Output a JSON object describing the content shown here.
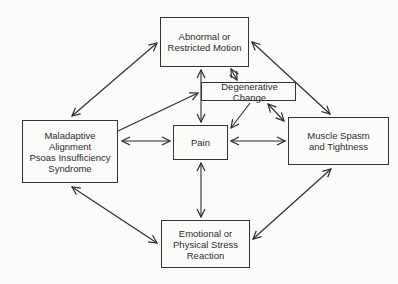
{
  "diagram": {
    "type": "flow",
    "nodes": [
      {
        "id": "abnormal",
        "label": "Abnormal or\nRestricted Motion"
      },
      {
        "id": "degen",
        "label": "Degenerative Change"
      },
      {
        "id": "malad",
        "label": "Maladaptive\nAlignment\nPsoas Insufficiency\nSyndrome"
      },
      {
        "id": "pain",
        "label": "Pain"
      },
      {
        "id": "muscle",
        "label": "Muscle Spasm\nand Tightness"
      },
      {
        "id": "emot",
        "label": "Emotional or\nPhysical Stress\nReaction"
      }
    ],
    "edges": [
      {
        "from": "malad",
        "to": "abnormal",
        "direction": "both"
      },
      {
        "from": "abnormal",
        "to": "muscle",
        "direction": "both"
      },
      {
        "from": "malad",
        "to": "emot",
        "direction": "both"
      },
      {
        "from": "muscle",
        "to": "emot",
        "direction": "both"
      },
      {
        "from": "abnormal",
        "to": "pain",
        "direction": "both"
      },
      {
        "from": "abnormal",
        "to": "degen",
        "direction": "both"
      },
      {
        "from": "malad",
        "to": "degen",
        "direction": "forward"
      },
      {
        "from": "degen",
        "to": "pain",
        "direction": "forward"
      },
      {
        "from": "degen",
        "to": "muscle",
        "direction": "both"
      },
      {
        "from": "malad",
        "to": "pain",
        "direction": "both"
      },
      {
        "from": "pain",
        "to": "muscle",
        "direction": "both"
      },
      {
        "from": "pain",
        "to": "emot",
        "direction": "both"
      }
    ]
  }
}
